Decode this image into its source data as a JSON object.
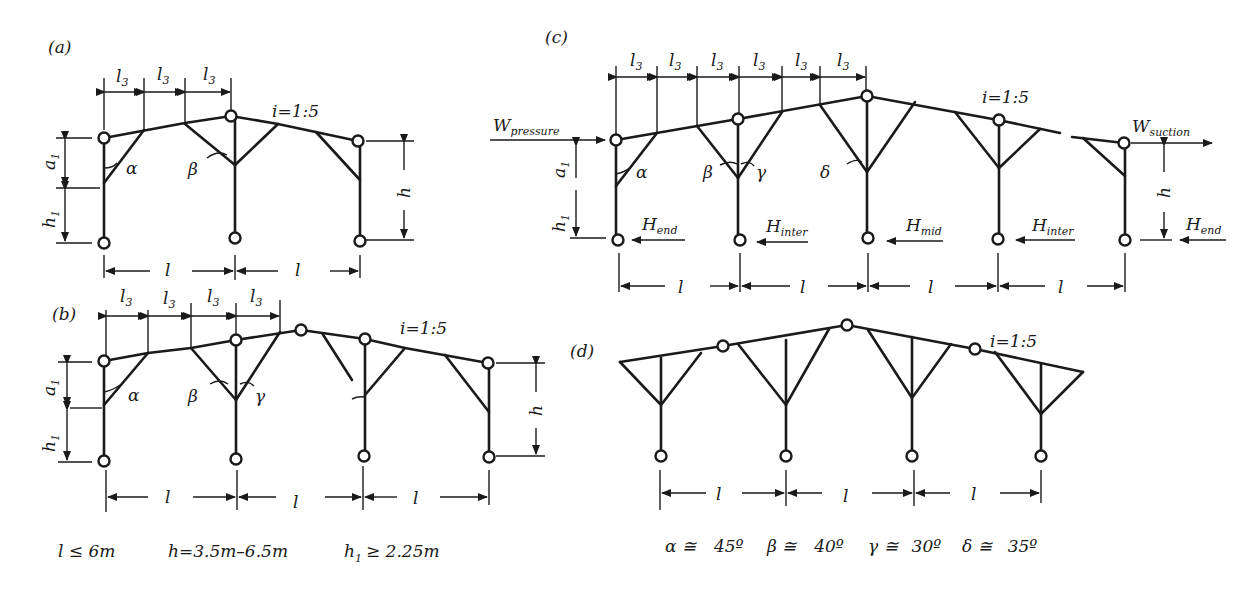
{
  "panels": {
    "a": {
      "label": "(a)",
      "slope": "i=1:5",
      "dims": [
        "l3",
        "l3",
        "l3"
      ],
      "spans": [
        "l",
        "l"
      ],
      "angles": [
        "α",
        "β"
      ],
      "heights": {
        "a1": "a",
        "h1": "h",
        "h": "h"
      }
    },
    "b": {
      "label": "(b)",
      "slope": "i=1:5",
      "dims": [
        "l3",
        "l3",
        "l3",
        "l3"
      ],
      "spans": [
        "l",
        "l",
        "l"
      ],
      "angles": [
        "α",
        "β",
        "γ"
      ]
    },
    "c": {
      "label": "(c)",
      "slope": "i=1:5",
      "dims": [
        "l3",
        "l3",
        "l3",
        "l3",
        "l3",
        "l3"
      ],
      "spans": [
        "l",
        "l",
        "l",
        "l"
      ],
      "angles": [
        "α",
        "β",
        "γ",
        "δ"
      ],
      "loads": {
        "w_pressure": "W",
        "w_pressure_sub": "pressure",
        "w_suction": "W",
        "w_suction_sub": "suction",
        "h_end": "H",
        "h_end_sub": "end",
        "h_inter": "H",
        "h_inter_sub": "inter",
        "h_mid": "H",
        "h_mid_sub": "mid"
      }
    },
    "d": {
      "label": "(d)",
      "slope": "i=1:5",
      "spans": [
        "l",
        "l",
        "l"
      ]
    }
  },
  "symbols": {
    "l": "l",
    "l_sub": "3",
    "a": "a",
    "a_sub": "1",
    "h": "h",
    "h_sub": "1"
  },
  "constraints": {
    "span": "l ≤ 6m",
    "height": "h=3.5m–6.5m",
    "h1_sym": "h",
    "h1_sub": "1",
    "h1_val": "≥ 2.25m"
  },
  "angle_values": [
    {
      "sym": "α ≅",
      "val": "45º"
    },
    {
      "sym": "β ≅",
      "val": "40º"
    },
    {
      "sym": "γ ≅",
      "val": "30º"
    },
    {
      "sym": "δ ≅",
      "val": "35º"
    }
  ]
}
